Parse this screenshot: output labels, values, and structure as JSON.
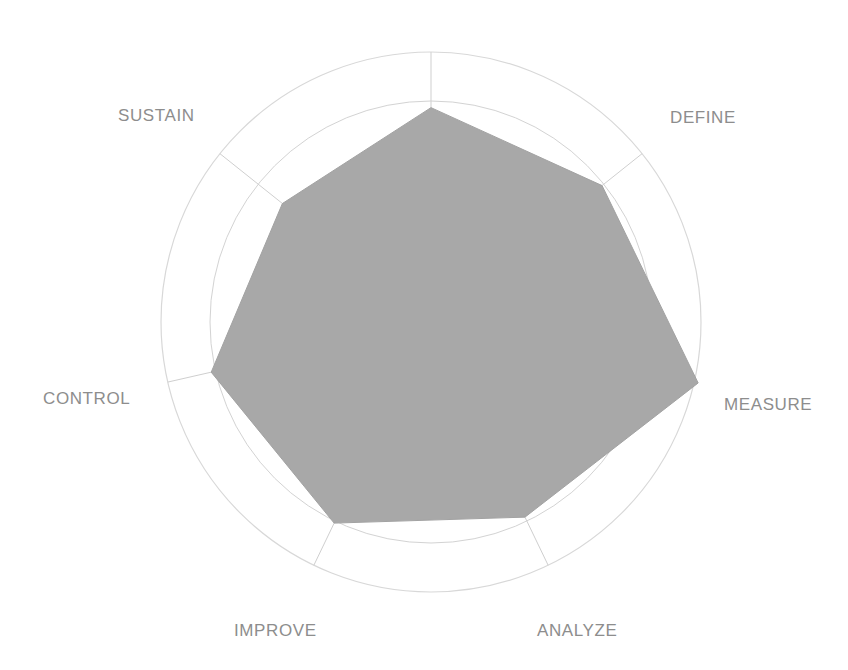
{
  "chart_data": {
    "type": "radar",
    "title": "",
    "subtitle": "",
    "xlabel": "",
    "ylabel": "",
    "grid": true,
    "legend_position": "none",
    "rings": 5,
    "scale_min": 0,
    "scale_max": 5,
    "outer_boundary_value": 6.2,
    "axes_count": 7,
    "categories": [
      "",
      "DEFINE",
      "MEASURE",
      "ANALYZE",
      "IMPROVE",
      "CONTROL",
      "SUSTAIN"
    ],
    "series": [
      {
        "name": "Assessment",
        "values": [
          4.85,
          4.95,
          6.2,
          4.9,
          5.05,
          5.1,
          4.3
        ],
        "fill_color": "#a8a8a8",
        "fill_opacity": 1
      }
    ],
    "tick_labels": [],
    "annotations": []
  },
  "labels": {
    "sustain": "SUSTAIN",
    "define": "DEFINE",
    "measure": "MEASURE",
    "control": "CONTROL",
    "improve": "IMPROVE",
    "analyze": "ANALYZE"
  },
  "colors": {
    "background": "#ffffff",
    "grid_line": "#d3d3d3",
    "outer_ring": "#d8d8d8",
    "spoke": "#cfcfcf",
    "data_fill": "#a8a8a8",
    "label_text": "#8d8d8d"
  },
  "geometry": {
    "center_x": 431,
    "center_y": 322,
    "outer_radius": 270,
    "grid_radius": 221
  }
}
